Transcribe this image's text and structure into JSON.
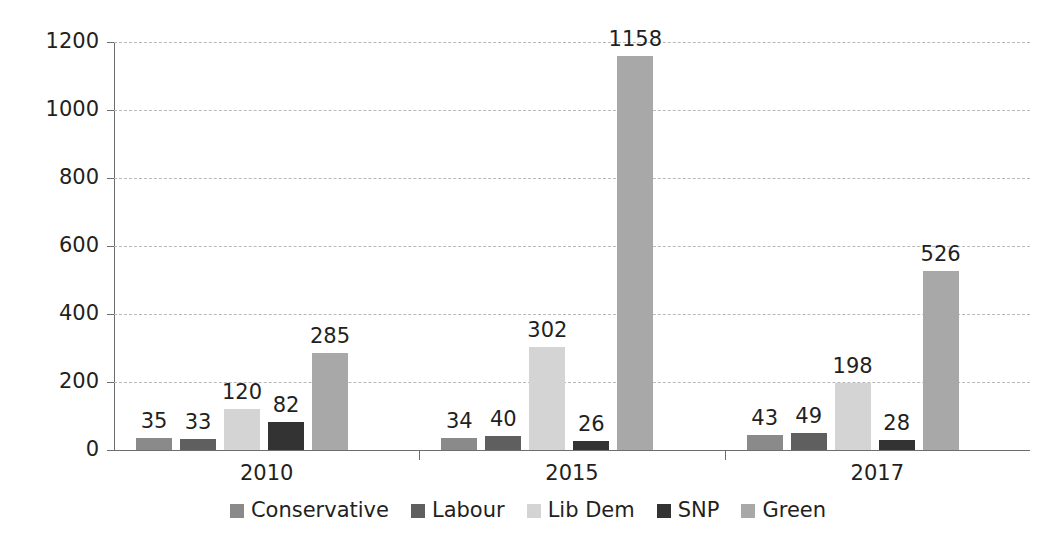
{
  "chart_data": {
    "type": "bar",
    "title": "",
    "subtitle": "",
    "xlabel": "",
    "ylabel": "",
    "categories": [
      "2010",
      "2015",
      "2017"
    ],
    "series": [
      {
        "name": "Conservative",
        "color": "#8a8a8a",
        "values": [
          35,
          34,
          43
        ]
      },
      {
        "name": "Labour",
        "color": "#5f5f5f",
        "values": [
          33,
          40,
          49
        ]
      },
      {
        "name": "Lib Dem",
        "color": "#d4d4d4",
        "values": [
          120,
          302,
          198
        ]
      },
      {
        "name": "SNP",
        "color": "#333333",
        "values": [
          82,
          26,
          28
        ]
      },
      {
        "name": "Green",
        "color": "#a8a8a8",
        "values": [
          285,
          1158,
          526
        ]
      }
    ],
    "ylim": [
      0,
      1200
    ],
    "y_ticks": [
      0,
      200,
      400,
      600,
      800,
      1000,
      1200
    ],
    "y_tick_labels": [
      "0",
      "200",
      "400",
      "600",
      "800",
      "1000",
      "1200"
    ],
    "grid": true,
    "legend_position": "bottom",
    "data_labels": true,
    "annotations": []
  }
}
